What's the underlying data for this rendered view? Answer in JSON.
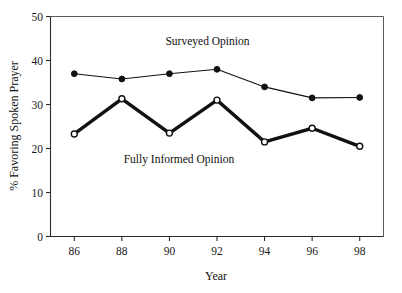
{
  "chart_data": {
    "type": "line",
    "title": "",
    "xlabel": "Year",
    "ylabel": "% Favoring Spoken Prayer",
    "x": [
      86,
      88,
      90,
      92,
      94,
      96,
      98
    ],
    "categories": [
      "86",
      "88",
      "90",
      "92",
      "94",
      "96",
      "98"
    ],
    "xlim": [
      85,
      99
    ],
    "ylim": [
      0,
      50
    ],
    "yticks": [
      0,
      10,
      20,
      30,
      40,
      50
    ],
    "ytick_labels": [
      "0",
      "10",
      "20",
      "30",
      "40",
      "50"
    ],
    "xtick_labels": [
      "86",
      "88",
      "90",
      "92",
      "94",
      "96",
      "98"
    ],
    "grid": false,
    "legend_position": "inline-annotation",
    "series": [
      {
        "name": "Surveyed Opinion",
        "marker": "filled-circle",
        "line_width": "thin",
        "color": "#111111",
        "values": [
          37.0,
          35.8,
          37.0,
          38.0,
          34.0,
          31.5,
          31.6
        ]
      },
      {
        "name": "Fully Informed Opinion",
        "marker": "open-circle",
        "line_width": "thick",
        "color": "#111111",
        "values": [
          23.3,
          31.3,
          23.5,
          31.0,
          21.5,
          24.6,
          20.5
        ]
      }
    ],
    "annotations": [
      {
        "text": "Surveyed Opinion",
        "x": 91.6,
        "y": 43.5
      },
      {
        "text": "Fully Informed Opinion",
        "x": 90.4,
        "y": 16.6
      }
    ]
  },
  "axis": {
    "y_title": "% Favoring Spoken Prayer",
    "x_title": "Year"
  }
}
